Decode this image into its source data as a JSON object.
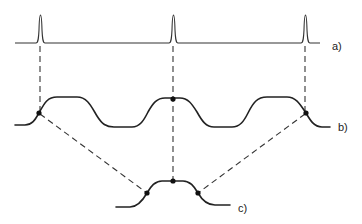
{
  "labels": {
    "a": "a)",
    "b": "b)",
    "c": "c)"
  },
  "colors": {
    "stroke": "#222222",
    "background": "#ffffff"
  },
  "diagram": {
    "pulse_positions_x": [
      40,
      173,
      305
    ],
    "curve_b_sample_points": [
      [
        39,
        113
      ],
      [
        173,
        100
      ],
      [
        306,
        113
      ]
    ],
    "curve_c_points": [
      [
        147,
        193
      ],
      [
        173,
        181
      ],
      [
        198,
        193
      ]
    ]
  }
}
